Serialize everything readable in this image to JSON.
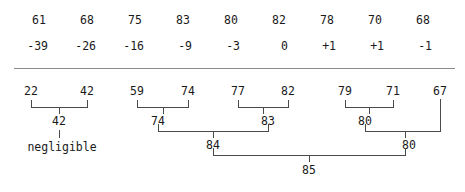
{
  "diagram": {
    "type": "hierarchical-merge-tree",
    "divider_color": "#8a8a8a",
    "line_color": "#4a4a4a",
    "text_color": "#1a1a1a",
    "top_table": {
      "row_values": [
        "61",
        "68",
        "75",
        "83",
        "80",
        "82",
        "78",
        "70",
        "68"
      ],
      "row_deltas": [
        "-39",
        "-26",
        "-16",
        "-9",
        "-3",
        "0",
        "+1",
        "+1",
        "-1"
      ]
    },
    "leaves": [
      "22",
      "42",
      "59",
      "74",
      "77",
      "82",
      "79",
      "71",
      "67"
    ],
    "level1": [
      {
        "label": "42",
        "children": [
          "22",
          "42"
        ]
      },
      {
        "label": "74",
        "children": [
          "59",
          "74"
        ]
      },
      {
        "label": "83",
        "children": [
          "77",
          "82"
        ]
      },
      {
        "label": "80",
        "children": [
          "79",
          "71"
        ]
      }
    ],
    "level2": [
      {
        "label": "84",
        "children": [
          "74",
          "83"
        ]
      },
      {
        "label": "80",
        "children": [
          "80",
          "67"
        ]
      }
    ],
    "level3": [
      {
        "label": "85",
        "children": [
          "84",
          "80"
        ]
      }
    ],
    "annotation": "negligible"
  }
}
